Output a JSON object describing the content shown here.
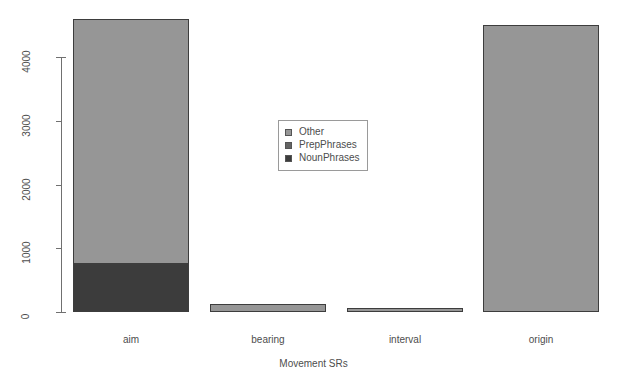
{
  "chart_data": {
    "type": "bar",
    "subtype": "stacked",
    "title": "",
    "xlabel": "Movement SRs",
    "ylabel": "",
    "categories": [
      "aim",
      "bearing",
      "interval",
      "origin"
    ],
    "series": [
      {
        "name": "Other",
        "color": "#969696",
        "values": [
          3850,
          120,
          70,
          4500
        ]
      },
      {
        "name": "PrepPhrases",
        "color": "#646464",
        "values": [
          0,
          0,
          0,
          0
        ]
      },
      {
        "name": "NounPhrases",
        "color": "#3c3c3c",
        "values": [
          750,
          0,
          0,
          0
        ]
      }
    ],
    "totals": [
      4600,
      120,
      70,
      4500
    ],
    "yticks": [
      0,
      1000,
      2000,
      3000,
      4000
    ],
    "ylim": [
      0,
      4015
    ],
    "xlim_labels": [
      "aim",
      "bearing",
      "interval",
      "origin"
    ],
    "grid": false,
    "legend": {
      "position": "center",
      "entries": [
        "Other",
        "PrepPhrases",
        "NounPhrases"
      ]
    }
  },
  "axis": {
    "y": {
      "tick_labels": [
        "0",
        "1000",
        "2000",
        "3000",
        "4000"
      ]
    },
    "x": {
      "tick_labels": [
        "aim",
        "bearing",
        "interval",
        "origin"
      ],
      "title": "Movement SRs"
    }
  },
  "legend": {
    "items": [
      {
        "label": "Other",
        "color": "#969696"
      },
      {
        "label": "PrepPhrases",
        "color": "#646464"
      },
      {
        "label": "NounPhrases",
        "color": "#3c3c3c"
      }
    ]
  },
  "colors": {
    "other": "#969696",
    "prep_phrases": "#646464",
    "noun_phrases": "#3c3c3c",
    "axis": "#707070",
    "text": "#4d4d4d",
    "background": "#ffffff",
    "bar_border": "#3d3d3d"
  }
}
